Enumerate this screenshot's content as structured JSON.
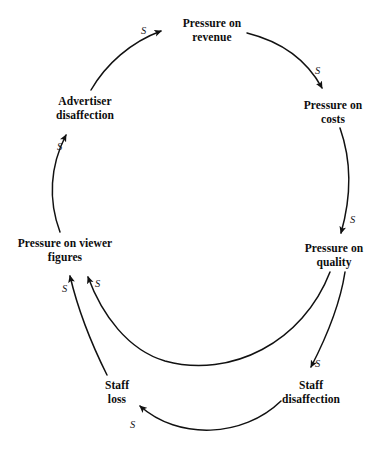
{
  "diagram": {
    "type": "causal-loop-diagram",
    "background_color": "#ffffff",
    "stroke_color": "#111111",
    "text_color": "#0d0d0d",
    "nodes": [
      {
        "id": "pressure-revenue",
        "label": "Pressure on\nrevenue",
        "x": 212,
        "y": 30
      },
      {
        "id": "pressure-costs",
        "label": "Pressure on\ncosts",
        "x": 333,
        "y": 112
      },
      {
        "id": "pressure-quality",
        "label": "Pressure on\nquality",
        "x": 334,
        "y": 255
      },
      {
        "id": "staff-disaffection",
        "label": "Staff\ndisaffection",
        "x": 311,
        "y": 392
      },
      {
        "id": "staff-loss",
        "label": "Staff\nloss",
        "x": 117,
        "y": 392
      },
      {
        "id": "pressure-viewer",
        "label": "Pressure on viewer\nfigures",
        "x": 65,
        "y": 250
      },
      {
        "id": "advertiser-disaffection",
        "label": "Advertiser\ndisaffection",
        "x": 85,
        "y": 108
      }
    ],
    "links": [
      {
        "id": "link-advertiser-to-revenue",
        "from": "advertiser-disaffection",
        "to": "pressure-revenue",
        "polarity": "S",
        "label_x": 141,
        "label_y": 25
      },
      {
        "id": "link-revenue-to-costs",
        "from": "pressure-revenue",
        "to": "pressure-costs",
        "polarity": "S",
        "label_x": 315,
        "label_y": 65
      },
      {
        "id": "link-costs-to-quality",
        "from": "pressure-costs",
        "to": "pressure-quality",
        "polarity": "S",
        "label_x": 350,
        "label_y": 214
      },
      {
        "id": "link-quality-to-staff-disaffection",
        "from": "pressure-quality",
        "to": "staff-disaffection",
        "polarity": "S",
        "label_x": 315,
        "label_y": 358
      },
      {
        "id": "link-staff-disaffection-to-staff-loss",
        "from": "staff-disaffection",
        "to": "staff-loss",
        "polarity": "S",
        "label_x": 130,
        "label_y": 419
      },
      {
        "id": "link-staff-loss-to-viewer",
        "from": "staff-loss",
        "to": "pressure-viewer",
        "polarity": "S",
        "label_x": 62,
        "label_y": 283
      },
      {
        "id": "link-quality-to-viewer",
        "from": "pressure-quality",
        "to": "pressure-viewer",
        "polarity": "S",
        "label_x": 95,
        "label_y": 278
      },
      {
        "id": "link-viewer-to-advertiser",
        "from": "pressure-viewer",
        "to": "advertiser-disaffection",
        "polarity": "S",
        "label_x": 57,
        "label_y": 141
      }
    ]
  }
}
